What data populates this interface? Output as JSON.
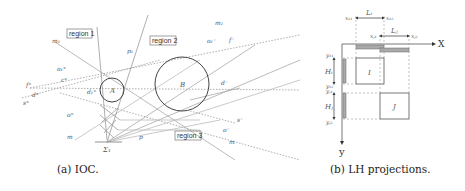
{
  "figure_a": {
    "caption": "(a) IOC.",
    "regions": [
      "region 1",
      "region 2",
      "region 3"
    ],
    "circles": [
      "A",
      "B"
    ],
    "labels": {
      "m1": "m₁",
      "p1": "p₁",
      "m_top": "m₁",
      "o1plus": "o₁⁺",
      "o1minus": "o₁⁻",
      "fplus": "f⁺",
      "fminus": "f⁻",
      "cplus": "c⁺",
      "dplus": "d⁺",
      "d1plus": "d₁⁺",
      "splus": "s⁺",
      "oplus": "o⁺",
      "m_bottom": "m",
      "p": "p",
      "sigma1": "Σ₁",
      "dminus": "d⁻",
      "sminus": "s⁻",
      "ominus": "o⁻",
      "m_right": "m"
    }
  },
  "figure_b": {
    "caption": "(b) LH projections.",
    "axis_x": "X",
    "axis_y": "y",
    "boxes": [
      "I",
      "J"
    ],
    "labels": {
      "xI1": "x₁₁",
      "xI2": "x₁₂",
      "LI": "Lᵢ",
      "xJ1": "xⱼ₁",
      "xJ2": "xⱼ₂",
      "LJ": "Lⱼ",
      "yI1": "y₁₁",
      "yI2": "y₁₂",
      "HI": "Hᵢ",
      "yJ1": "yⱼ₁",
      "yJ2": "yⱼ₂",
      "HJ": "Hⱼ"
    }
  }
}
